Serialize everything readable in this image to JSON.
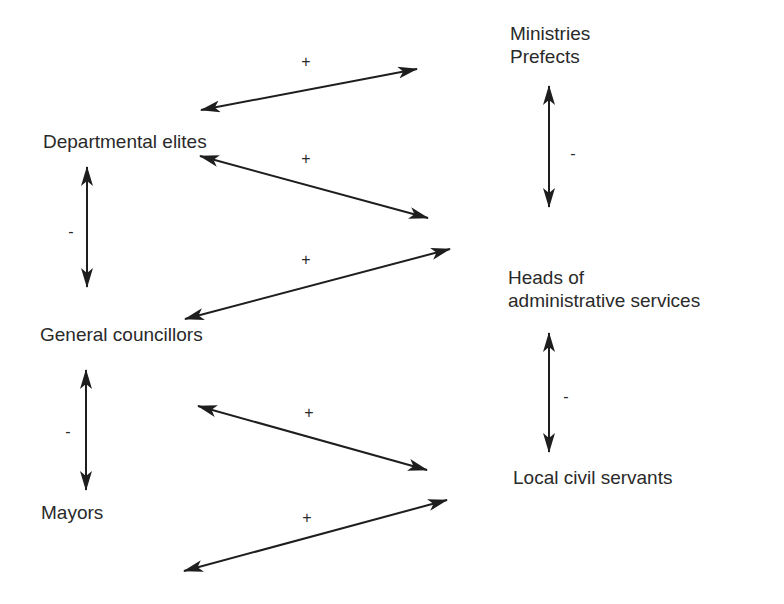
{
  "diagram": {
    "type": "relationship-diagram",
    "background": "#ffffff",
    "stroke_color": "#1e1e1e",
    "nodes": {
      "ministries": {
        "lines": [
          "Ministries",
          "Prefects"
        ]
      },
      "departmental_elites": {
        "label": "Departmental elites"
      },
      "heads": {
        "lines": [
          "Heads of",
          "administrative services"
        ]
      },
      "general_councillors": {
        "label": "General councillors"
      },
      "local_civil_servants": {
        "label": "Local civil servants"
      },
      "mayors": {
        "label": "Mayors"
      }
    },
    "edges": [
      {
        "from": "Departmental elites",
        "to": "Ministries / Prefects",
        "sign": "+"
      },
      {
        "from": "Departmental elites",
        "to": "Heads of administrative services",
        "sign": "+"
      },
      {
        "from": "General councillors",
        "to": "Heads of administrative services",
        "sign": "+"
      },
      {
        "from": "General councillors",
        "to": "Local civil servants",
        "sign": "+"
      },
      {
        "from": "Mayors",
        "to": "Local civil servants",
        "sign": "+"
      },
      {
        "from": "Departmental elites",
        "to": "General councillors",
        "sign": "-"
      },
      {
        "from": "General councillors",
        "to": "Mayors",
        "sign": "-"
      },
      {
        "from": "Ministries / Prefects",
        "to": "Heads of administrative services",
        "sign": "-"
      },
      {
        "from": "Heads of administrative services",
        "to": "Local civil servants",
        "sign": "-"
      }
    ],
    "signs": {
      "plus": "+",
      "minus": "-"
    }
  }
}
